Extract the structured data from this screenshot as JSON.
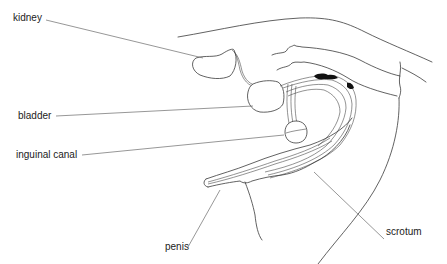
{
  "diagram": {
    "type": "anatomical line drawing",
    "labels": {
      "kidney": "kidney",
      "bladder": "bladder",
      "inguinal_canal": "inguinal canal",
      "penis": "penis",
      "scrotum": "scrotum"
    },
    "colors": {
      "line": "#3a3a3a",
      "leader": "#6a6a6a",
      "text": "#222222",
      "background": "#ffffff",
      "marker": "#111111"
    }
  }
}
